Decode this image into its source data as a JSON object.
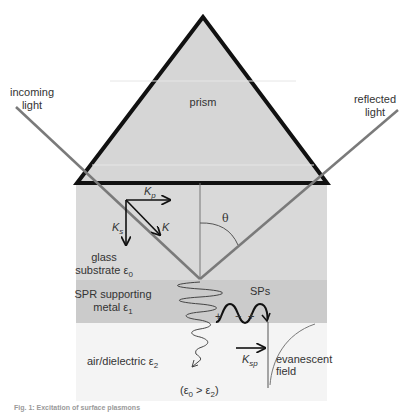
{
  "labels": {
    "prism": "prism",
    "incoming_light_1": "incoming",
    "incoming_light_2": "light",
    "reflected_light_1": "reflected",
    "reflected_light_2": "light",
    "theta": "θ",
    "kp_base": "K",
    "kp_sub": "p",
    "ks_base": "K",
    "ks_sub": "s",
    "k": "K",
    "glass_1": "glass",
    "glass_2": "substrate ε",
    "glass_sub": "0",
    "metal_1": "SPR supporting",
    "metal_2": "metal ε",
    "metal_sub": "1",
    "sps": "SPs",
    "plus1": "+",
    "minus": "−",
    "plus2": "+",
    "air": "air/dielectric ε",
    "air_sub": "2",
    "ksp_base": "K",
    "ksp_sub": "sp",
    "evanescent_1": "evanescent",
    "evanescent_2": "field",
    "condition_a": "(ε",
    "condition_a_sub": "0",
    "condition_b": " > ε",
    "condition_b_sub": "2",
    "condition_c": ")",
    "caption": "Fig. 1: Excitation of surface plasmons"
  },
  "colors": {
    "prism_fill": "#d6d6d6",
    "glass_fill": "#d9d9d9",
    "metal_fill": "#cbcbcb",
    "air_fill": "#f4f4f4",
    "outline": "#111111",
    "beam": "#7a7a7a",
    "text": "#333333"
  }
}
